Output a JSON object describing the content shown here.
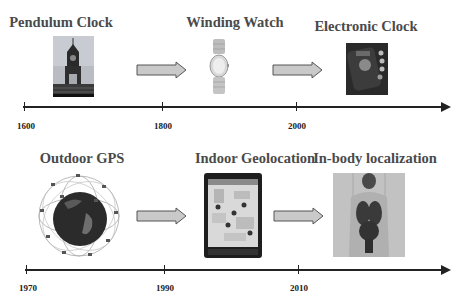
{
  "timelines": [
    {
      "name": "timekeeping",
      "items": [
        {
          "title": "Pendulum Clock",
          "image": "clock-tower"
        },
        {
          "title": "Winding Watch",
          "image": "wristwatch"
        },
        {
          "title": "Electronic Clock",
          "image": "electronic-device"
        }
      ],
      "ticks": [
        "1600",
        "1800",
        "2000"
      ]
    },
    {
      "name": "localization",
      "items": [
        {
          "title": "Outdoor GPS",
          "image": "gps-satellite-globe"
        },
        {
          "title": "Indoor Geolocation",
          "image": "tablet-indoor-map"
        },
        {
          "title": "In-body localization",
          "image": "human-body-organs"
        }
      ],
      "ticks": [
        "1970",
        "1990",
        "2010"
      ]
    }
  ],
  "caption": "Figure 1.1   Comparison of ..."
}
